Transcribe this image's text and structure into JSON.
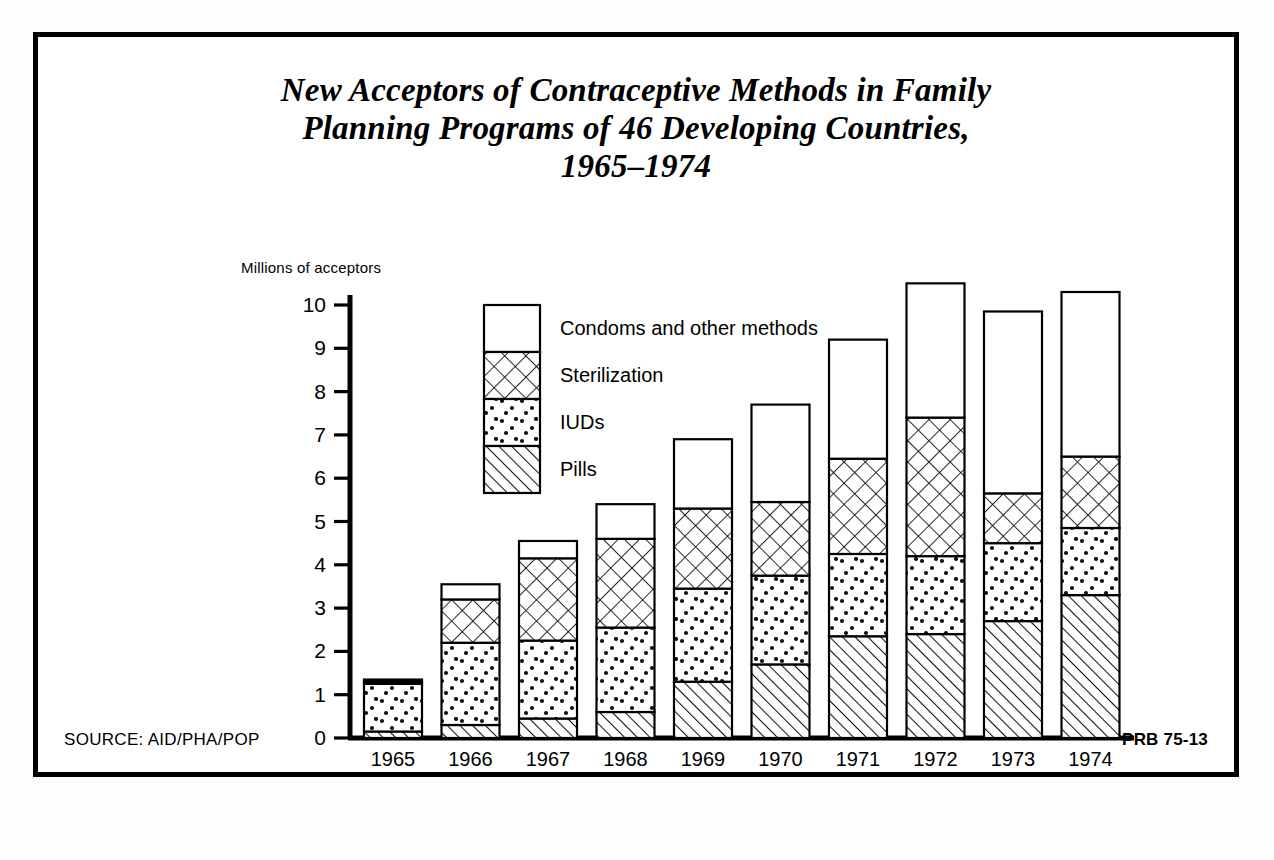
{
  "poster": {
    "title_lines": [
      "New Acceptors of Contraceptive Methods in Family",
      "Planning Programs of 46 Developing Countries,",
      "1965–1974"
    ],
    "source_label": "SOURCE: AID/PHA/POP",
    "publication_code": "PRB 75-13",
    "colors": {
      "ink": "#000000",
      "paper": "#ffffff"
    }
  },
  "chart_data": {
    "type": "bar",
    "stacked": true,
    "title": "New Acceptors of Contraceptive Methods in Family Planning Programs of 46 Developing Countries, 1965–1974",
    "xlabel": "",
    "ylabel": "Millions of acceptors",
    "ylim": [
      0,
      10.8
    ],
    "yticks": [
      0,
      1,
      2,
      3,
      4,
      5,
      6,
      7,
      8,
      9,
      10
    ],
    "ytick_labels": [
      "0",
      "1",
      "2",
      "3",
      "4",
      "5",
      "6",
      "7",
      "8",
      "9",
      "10"
    ],
    "grid": false,
    "legend_position": "inside-upper-left",
    "categories": [
      "1965",
      "1966",
      "1967",
      "1968",
      "1969",
      "1970",
      "1971",
      "1972",
      "1973",
      "1974"
    ],
    "series": [
      {
        "name": "Pills",
        "pattern": "diagonal-hatch",
        "values": [
          0.15,
          0.3,
          0.45,
          0.6,
          1.3,
          1.7,
          2.35,
          2.4,
          2.7,
          3.3
        ]
      },
      {
        "name": "IUDs",
        "pattern": "dots",
        "values": [
          1.1,
          1.9,
          1.8,
          1.95,
          2.15,
          2.05,
          1.9,
          1.8,
          1.8,
          1.55
        ]
      },
      {
        "name": "Sterilization",
        "pattern": "cross-hatch",
        "values": [
          0.05,
          1.0,
          1.9,
          2.05,
          1.85,
          1.7,
          2.2,
          3.2,
          1.15,
          1.65
        ]
      },
      {
        "name": "Condoms and other methods",
        "pattern": "blank",
        "values": [
          0.05,
          0.35,
          0.4,
          0.8,
          1.6,
          2.25,
          2.75,
          3.1,
          4.2,
          3.8
        ]
      }
    ],
    "cumulative_tops": {
      "pills": [
        0.15,
        0.3,
        0.45,
        0.6,
        1.3,
        1.7,
        2.35,
        2.4,
        2.7,
        3.3
      ],
      "iuds": [
        1.25,
        2.2,
        2.25,
        2.55,
        3.45,
        3.75,
        4.25,
        4.2,
        4.5,
        4.85
      ],
      "sterilization": [
        1.3,
        3.2,
        4.15,
        4.6,
        5.3,
        5.45,
        6.45,
        7.4,
        5.65,
        6.5
      ],
      "total": [
        1.35,
        3.55,
        4.55,
        5.4,
        6.9,
        7.7,
        9.2,
        10.5,
        9.85,
        10.3
      ]
    },
    "legend": [
      {
        "label": "Condoms and other methods",
        "pattern": "blank"
      },
      {
        "label": "Sterilization",
        "pattern": "cross-hatch"
      },
      {
        "label": "IUDs",
        "pattern": "dots"
      },
      {
        "label": "Pills",
        "pattern": "diagonal-hatch"
      }
    ]
  }
}
